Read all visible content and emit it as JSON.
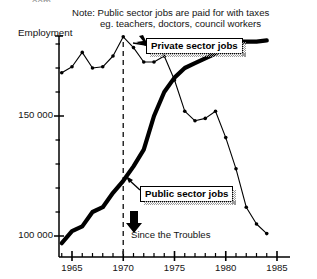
{
  "fragment": {
    "text": "oom"
  },
  "note": {
    "line1": "Note: Public sector jobs are paid for with taxes",
    "line2": "eg. teachers, doctors, council workers"
  },
  "axis_title": "Employment",
  "callouts": {
    "private": "Private sector jobs",
    "public": "Public sector jobs"
  },
  "annotation": {
    "troubles": "Since the Troubles",
    "troubles_year": 1970
  },
  "colors": {
    "line": "#000000",
    "text": "#141414",
    "background": "#ffffff",
    "shadow": "#9a9a9a"
  },
  "chart_data": {
    "type": "line",
    "title": "",
    "subtitle": "",
    "xlabel": "",
    "ylabel": "Employment",
    "xlim": [
      1963.5,
      1985
    ],
    "ylim": [
      88000,
      190000
    ],
    "grid": false,
    "legend": "inline-callouts",
    "xticks_major": [
      1965,
      1970,
      1975,
      1980,
      1985
    ],
    "xticks_major_labels": [
      "1965",
      "1970",
      "1975",
      "1980",
      "1985"
    ],
    "xticks_minor_step": 1,
    "yticks_major": [
      100000,
      150000
    ],
    "yticks_major_labels": [
      "100 000",
      "150 000"
    ],
    "yticks_minor": [
      110000,
      120000,
      130000,
      140000,
      160000,
      170000,
      180000
    ],
    "vline": {
      "x": 1970,
      "style": "dashed",
      "label": "Since the Troubles"
    },
    "series": [
      {
        "name": "Private sector jobs",
        "style": "thin-line-with-dots",
        "x": [
          1964,
          1965,
          1966,
          1967,
          1968,
          1969,
          1970,
          1971,
          1972,
          1973,
          1974,
          1975,
          1976,
          1977,
          1978,
          1979,
          1980,
          1981,
          1982,
          1983,
          1984
        ],
        "values": [
          168000,
          170500,
          176500,
          170000,
          170500,
          175000,
          183000,
          178500,
          172500,
          172500,
          175000,
          165000,
          152000,
          148000,
          149000,
          152000,
          141000,
          128000,
          112000,
          105000,
          101000
        ]
      },
      {
        "name": "Public sector jobs",
        "style": "thick-line",
        "x": [
          1964,
          1965,
          1966,
          1967,
          1968,
          1969,
          1970,
          1971,
          1972,
          1973,
          1974,
          1975,
          1976,
          1977,
          1978,
          1979,
          1980,
          1981,
          1982,
          1983,
          1984
        ],
        "values": [
          97000,
          102000,
          104000,
          110000,
          112000,
          118000,
          123000,
          129000,
          136000,
          150000,
          160000,
          166000,
          170000,
          172000,
          174000,
          176000,
          179000,
          181000,
          181000,
          181000,
          181500
        ]
      }
    ]
  }
}
